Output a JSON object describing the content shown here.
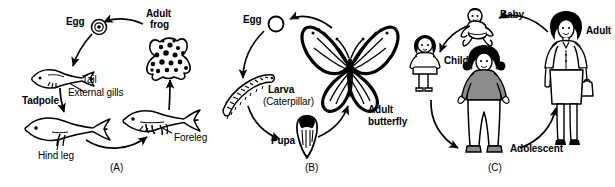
{
  "figure": {
    "type": "life-cycle-diagram",
    "panel_count": 3,
    "background_color": "#ffffff",
    "ink_color": "#000000"
  },
  "panel_a": {
    "caption": "(A)",
    "subject": "frog",
    "stages": [
      {
        "key": "egg",
        "label": "Egg",
        "bold": true,
        "icon": "egg-concentric-circle"
      },
      {
        "key": "adult",
        "label": "Adult\nfrog",
        "line1": "Adult",
        "line2": "frog",
        "bold": true,
        "icon": "spotted-frog"
      },
      {
        "key": "tadpole",
        "label": "Tadpole",
        "bold": true,
        "icon": "tadpole-early"
      },
      {
        "key": "tadpole_hind",
        "label": "",
        "bold": false,
        "icon": "tadpole-hind-legs"
      },
      {
        "key": "tadpole_fore",
        "label": "",
        "bold": false,
        "icon": "tadpole-four-legs"
      }
    ],
    "annotations": [
      {
        "key": "tail",
        "label": "Tail",
        "bold": false
      },
      {
        "key": "external_gills",
        "label": "External gills",
        "bold": false
      },
      {
        "key": "hind_leg",
        "label": "Hind leg",
        "bold": false
      },
      {
        "key": "foreleg",
        "label": "Foreleg",
        "bold": false
      }
    ]
  },
  "panel_b": {
    "caption": "(B)",
    "subject": "butterfly",
    "stages": [
      {
        "key": "egg",
        "label": "Egg",
        "bold": true,
        "icon": "egg-hollow-circle"
      },
      {
        "key": "larva",
        "label": "Larva",
        "bold": true,
        "icon": "caterpillar"
      },
      {
        "key": "larva_alt",
        "label": "(Caterpillar)",
        "bold": false
      },
      {
        "key": "pupa",
        "label": "Pupa",
        "bold": true,
        "icon": "chrysalis"
      },
      {
        "key": "adult",
        "line1": "Adult",
        "line2": "butterfly",
        "label": "Adult\nbutterfly",
        "bold": true,
        "icon": "monarch-butterfly"
      }
    ]
  },
  "panel_c": {
    "caption": "(C)",
    "subject": "human",
    "stages": [
      {
        "key": "baby",
        "label": "Baby",
        "bold": true,
        "icon": "crawling-baby"
      },
      {
        "key": "child",
        "label": "Child",
        "bold": true,
        "icon": "standing-child"
      },
      {
        "key": "adolescent",
        "label": "Adolescent",
        "bold": true,
        "icon": "standing-teen"
      },
      {
        "key": "adult",
        "label": "Adult",
        "bold": true,
        "icon": "standing-woman"
      }
    ]
  }
}
